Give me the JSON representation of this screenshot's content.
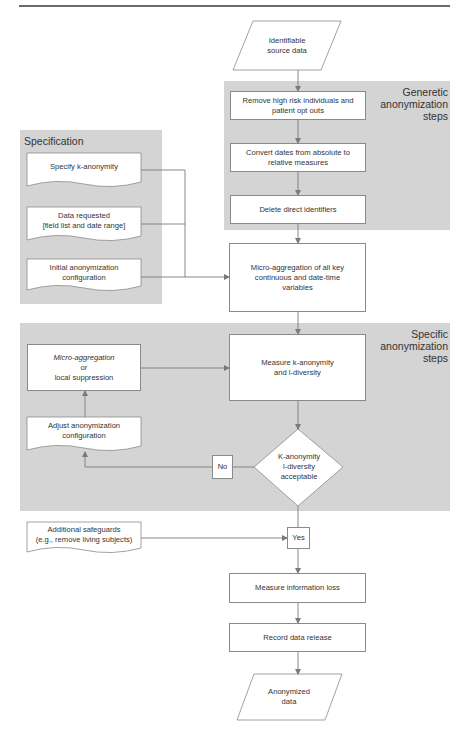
{
  "header": {
    "text": ""
  },
  "colors": {
    "panel": "#d4d4d4",
    "line": "#7a7a7a",
    "box_border": "#8a8a8a",
    "text": "#333333"
  },
  "panels": {
    "generic": {
      "title": "Generetic\nanonymization\nsteps"
    },
    "specification": {
      "title": "Specification"
    },
    "specific": {
      "title": "Specific\nanonymization\nsteps"
    }
  },
  "nodes": {
    "source": {
      "label": "Identifiable\nsource data",
      "shape": "data-parallelogram"
    },
    "remove_high_risk": {
      "label": "Remove high risk individuals and\npatient opt outs",
      "shape": "process"
    },
    "convert_dates": {
      "label": "Convert dates from absolute to\nrelative measures",
      "shape": "process"
    },
    "delete_identifiers": {
      "label": "Delete direct identifiers",
      "shape": "process"
    },
    "specify_k": {
      "label": "Specify k-anonymity",
      "shape": "document"
    },
    "data_requested": {
      "label": "Data requested\n[field list and date range]",
      "shape": "document"
    },
    "initial_config": {
      "label": "Initial anonymization\nconfiguration",
      "shape": "document"
    },
    "micro_agg_all": {
      "label": "Micro-aggregation of all key\ncontinuous and date-time\nvariables",
      "shape": "process"
    },
    "micro_agg_or_suppress": {
      "line1": "Micro-aggregation",
      "line2": "or",
      "line3": "local suppression",
      "shape": "process"
    },
    "measure_k_l": {
      "label": "Measure k-anonymity\nand l-diversity",
      "shape": "process"
    },
    "adjust_config": {
      "label": "Adjust anonymization\nconfiguration",
      "shape": "document"
    },
    "decision": {
      "label": "K-anonymity\nl-diversity\nacceptable",
      "shape": "decision"
    },
    "no_label": {
      "label": "No"
    },
    "yes_label": {
      "label": "Yes"
    },
    "safeguards": {
      "label": "Additional safeguards\n(e.g., remove living subjects)",
      "shape": "document"
    },
    "measure_loss": {
      "label": "Measure information loss",
      "shape": "process"
    },
    "record_release": {
      "label": "Record data release",
      "shape": "process"
    },
    "anonymized": {
      "label": "Anonymized\ndata",
      "shape": "data-parallelogram"
    }
  }
}
